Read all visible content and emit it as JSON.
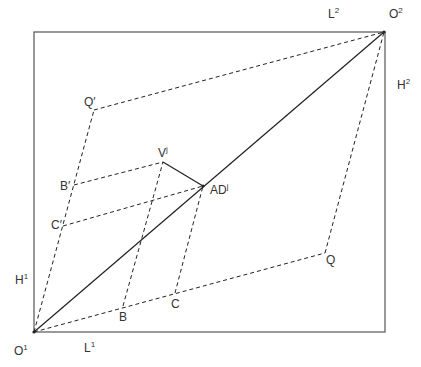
{
  "diagram": {
    "type": "edgeworth-box",
    "colors": {
      "stroke": "#222222",
      "box": "#555555",
      "text": "#333333"
    },
    "labels": {
      "O1": {
        "base": "O",
        "sup": "1"
      },
      "O2": {
        "base": "O",
        "sup": "2"
      },
      "L1": {
        "base": "L",
        "sup": "1"
      },
      "L2": {
        "base": "L",
        "sup": "2"
      },
      "H1": {
        "base": "H",
        "sup": "1"
      },
      "H2": {
        "base": "H",
        "sup": "2"
      },
      "Q": {
        "base": "Q",
        "sup": ""
      },
      "Qp": {
        "base": "Q′",
        "sup": ""
      },
      "B": {
        "base": "B",
        "sup": ""
      },
      "C": {
        "base": "C",
        "sup": ""
      },
      "Bp": {
        "base": "B′",
        "sup": ""
      },
      "Cp": {
        "base": "C′",
        "sup": ""
      },
      "V": {
        "base": "V",
        "sup": "j"
      },
      "AD": {
        "base": "AD",
        "sup": "j"
      }
    },
    "points": {
      "O1": [
        34,
        332
      ],
      "O2": [
        384,
        32
      ],
      "Q": [
        325,
        253
      ],
      "Qp": [
        94,
        110
      ],
      "B": [
        123,
        306
      ],
      "C": [
        175,
        293
      ],
      "Bp": [
        74,
        185
      ],
      "Cp": [
        63,
        226
      ],
      "V": [
        163,
        162
      ],
      "AD": [
        203,
        186
      ]
    }
  }
}
